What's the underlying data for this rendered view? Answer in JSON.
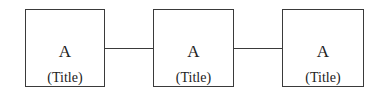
{
  "diagram": {
    "nodes": [
      {
        "id": "node-1",
        "label": "A",
        "title": "(Title)"
      },
      {
        "id": "node-2",
        "label": "A",
        "title": "(Title)"
      },
      {
        "id": "node-3",
        "label": "A",
        "title": "(Title)"
      }
    ],
    "edges": [
      {
        "from": "node-1",
        "to": "node-2"
      },
      {
        "from": "node-2",
        "to": "node-3"
      }
    ],
    "colors": {
      "stroke": "#3a3a3a",
      "background": "#ffffff",
      "text": "#222222"
    }
  }
}
